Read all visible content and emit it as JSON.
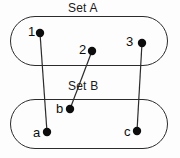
{
  "canvas": {
    "width": 180,
    "height": 158,
    "background": "#fdfdfd"
  },
  "style": {
    "stroke_color": "#2b2b2b",
    "node_fill": "#0d0d0d",
    "text_color": "#0d0d0d",
    "boundary_stroke_width": 1,
    "edge_stroke_width": 1.2,
    "node_radius": 4
  },
  "titles": {
    "set_a": "Set A",
    "set_b": "Set B"
  },
  "groups": [
    {
      "id": "set-a",
      "title": "Set A",
      "title_pos": {
        "x": 68,
        "y": 1
      },
      "boundary": {
        "x": 10,
        "y": 16,
        "width": 158,
        "height": 50,
        "radius": 25
      }
    },
    {
      "id": "set-b",
      "title": "Set B",
      "title_pos": {
        "x": 68,
        "y": 79
      },
      "boundary": {
        "x": 10,
        "y": 99,
        "width": 158,
        "height": 50,
        "radius": 25
      }
    }
  ],
  "nodes": [
    {
      "id": "1",
      "label": "1",
      "set": "set-a",
      "cx": 40,
      "cy": 33,
      "label_x": 28,
      "label_y": 25
    },
    {
      "id": "2",
      "label": "2",
      "set": "set-a",
      "cx": 92,
      "cy": 51,
      "label_x": 79,
      "label_y": 43
    },
    {
      "id": "3",
      "label": "3",
      "set": "set-a",
      "cx": 142,
      "cy": 43,
      "label_x": 126,
      "label_y": 35
    },
    {
      "id": "a",
      "label": "a",
      "set": "set-b",
      "cx": 47,
      "cy": 132,
      "label_x": 33,
      "label_y": 126
    },
    {
      "id": "b",
      "label": "b",
      "set": "set-b",
      "cx": 70,
      "cy": 109,
      "label_x": 56,
      "label_y": 102
    },
    {
      "id": "c",
      "label": "c",
      "set": "set-b",
      "cx": 137,
      "cy": 131,
      "label_x": 124,
      "label_y": 125
    }
  ],
  "edges": [
    {
      "id": "edge-1-a",
      "from": "1",
      "to": "a",
      "x1": 40,
      "y1": 33,
      "x2": 47,
      "y2": 132
    },
    {
      "id": "edge-2-b",
      "from": "2",
      "to": "b",
      "x1": 92,
      "y1": 51,
      "x2": 70,
      "y2": 109
    },
    {
      "id": "edge-3-c",
      "from": "3",
      "to": "c",
      "x1": 142,
      "y1": 43,
      "x2": 137,
      "y2": 131
    }
  ]
}
